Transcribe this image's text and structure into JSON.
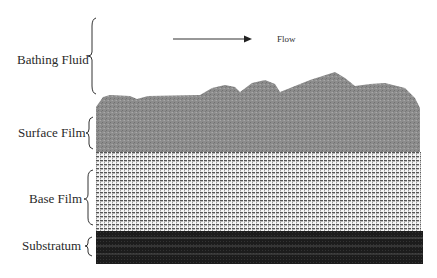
{
  "diagram": {
    "type": "biofilm layer cross-section",
    "flow": {
      "label": "Flow",
      "direction": "right"
    },
    "layers": [
      {
        "id": "bathing-fluid",
        "label": "Bathing Fluid",
        "fill": "#ffffff"
      },
      {
        "id": "surface-film",
        "label": "Surface Film",
        "fill": "#8f8f8f",
        "texture": "dense speckled gray"
      },
      {
        "id": "base-film",
        "label": "Base Film",
        "fill": "#d8d8d8",
        "texture": "fine grid of dark dashes on white"
      },
      {
        "id": "substratum",
        "label": "Substratum",
        "fill": "#1e1e1e",
        "texture": "dark with faint light horizontal lines"
      }
    ]
  },
  "colors": {
    "text": "#2a2a2a",
    "surface_film": "#8f8f8f",
    "base_film_bg": "#f2f2f2",
    "base_film_dash": "#5a5a5a",
    "substratum": "#1e1e1e",
    "substratum_lines": "#6a6a6a"
  }
}
